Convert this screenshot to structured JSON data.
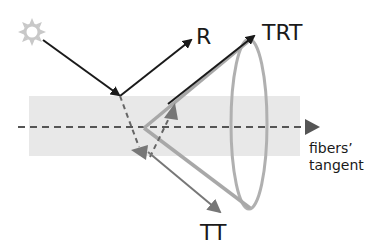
{
  "diagram": {
    "labels": {
      "reflection": "R",
      "transmission_reflection_transmission": "TRT",
      "transmission_transmission": "TT",
      "fiber_axis_line1": "fibers’",
      "fiber_axis_line2": "tangent"
    },
    "icons": {
      "light_source": "sun-icon"
    },
    "colors": {
      "background": "#ffffff",
      "fiber_band": "#e8e8e8",
      "sun": "#c8c8c8",
      "incident_and_R_ray": "#1a1a1a",
      "internal_dashed_ray": "#666666",
      "trt_tt_rays": "#a8a8a8",
      "tt_ray": "#777777",
      "cone_outline": "#b0b0b0",
      "axis_dashes": "#555555"
    },
    "elements": [
      "light source (sun)",
      "incident ray",
      "reflected ray R",
      "fiber cross-section band",
      "fiber tangent axis (dashed) with arrow",
      "internal refracted rays (dashed)",
      "TRT outgoing ray",
      "TT outgoing ray",
      "scattering cone (ellipse)"
    ]
  }
}
